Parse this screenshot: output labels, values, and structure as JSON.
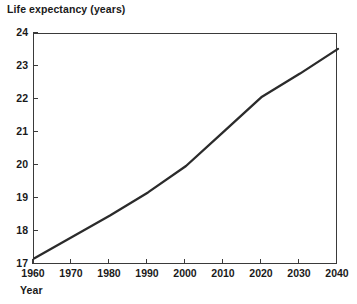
{
  "chart_data": {
    "type": "line",
    "title": "",
    "ylabel": "Life expectancy (years)",
    "xlabel": "Year",
    "x": [
      1960,
      1970,
      1980,
      1990,
      2000,
      2010,
      2020,
      2030,
      2040
    ],
    "values": [
      17.2,
      17.85,
      18.5,
      19.2,
      20.0,
      21.05,
      22.1,
      22.8,
      23.55
    ],
    "series": [
      {
        "name": "Life expectancy",
        "values": [
          17.2,
          17.85,
          18.5,
          19.2,
          20.0,
          21.05,
          22.1,
          22.8,
          23.55
        ]
      }
    ],
    "xlim": [
      1960,
      2040
    ],
    "ylim": [
      17,
      24
    ],
    "xticks": [
      1960,
      1970,
      1980,
      1990,
      2000,
      2010,
      2020,
      2030,
      2040
    ],
    "yticks": [
      17,
      18,
      19,
      20,
      21,
      22,
      23,
      24
    ],
    "xtick_labels": [
      "1960",
      "1970",
      "1980",
      "1990",
      "2000",
      "2010",
      "2020",
      "2030",
      "2040"
    ],
    "ytick_labels": [
      "17",
      "18",
      "19",
      "20",
      "21",
      "22",
      "23",
      "24"
    ],
    "grid": false,
    "legend": false,
    "legend_position": "none",
    "line_color": "#2b2b2b",
    "axis_color": "#3a3a3a",
    "background_color": "#ffffff"
  }
}
